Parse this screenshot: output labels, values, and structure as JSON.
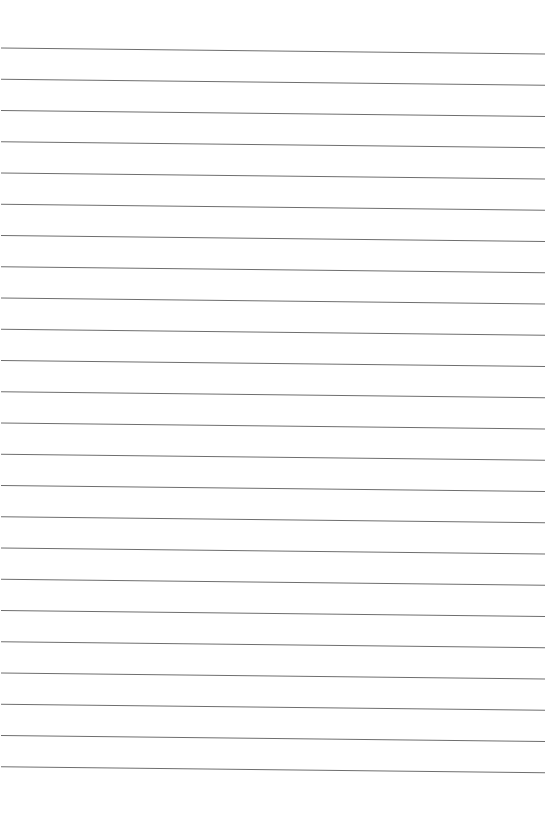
{
  "page": {
    "type": "lined-paper",
    "background": "#ffffff",
    "line_color": "#6e6e6e",
    "line_count": 24,
    "first_line_y_left": 48,
    "line_spacing": 31.25,
    "slope_dy": 6,
    "line_x_start": 1,
    "line_x_end": 545
  }
}
